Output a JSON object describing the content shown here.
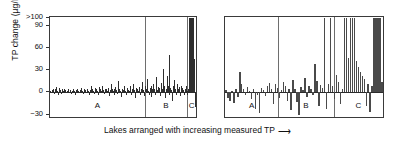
{
  "axes": {
    "ylabel": "TP change (µg/L)",
    "xlabel": "Lakes arranged with increasing measured TP",
    "xlabel_arrow": "⟶",
    "yticks": [
      {
        "label": ">100",
        "value": 100
      },
      {
        "label": "90",
        "value": 90
      },
      {
        "label": "60",
        "value": 60
      },
      {
        "label": "30",
        "value": 30
      },
      {
        "label": "0",
        "value": 0
      },
      {
        "label": "−30",
        "value": -30
      }
    ],
    "ylim": [
      -36,
      102
    ],
    "grid": false
  },
  "colors": {
    "bar": "#2e2e2e",
    "bar_wide": "#4a4a4a",
    "axis": "#3a3a3a",
    "divider": "#6e6e6e",
    "background": "#ffffff"
  },
  "panels": [
    {
      "name": "left-panel",
      "section_labels": [
        "A",
        "B",
        "C"
      ],
      "section_bounds": [
        [
          0,
          96
        ],
        [
          96,
          139
        ],
        [
          139,
          148
        ]
      ],
      "bar_width": 1.4
    },
    {
      "name": "right-panel",
      "section_labels": [
        "A",
        "B",
        "C"
      ],
      "section_bounds": [
        [
          0,
          54
        ],
        [
          54,
          110
        ],
        [
          110,
          160
        ]
      ],
      "bar_width": 3.2
    }
  ],
  "chart_data": {
    "type": "bar",
    "title": "",
    "xlabel": "Lakes arranged with increasing measured TP",
    "ylabel": "TP change (µg/L)",
    "ylim": [
      -36,
      102
    ],
    "ytick_values": [
      100,
      90,
      60,
      30,
      0,
      -30
    ],
    "ytick_labels": [
      ">100",
      "90",
      "60",
      "30",
      "0",
      "-30"
    ],
    "grid": false,
    "legend": "none",
    "note": "Two panels, each split into sections A, B, C by vertical dividers. Bars show TP change per lake; lakes sorted by increasing measured TP. Bars exceeding 100 are clipped at the top axis.",
    "panels": [
      {
        "name": "left-panel",
        "sections": [
          "A",
          "B",
          "C"
        ],
        "series": [
          {
            "name": "TP change",
            "values": [
              2,
              -1,
              3,
              5,
              -2,
              4,
              7,
              2,
              -3,
              6,
              3,
              1,
              -2,
              4,
              2,
              5,
              3,
              -1,
              2,
              4,
              1,
              3,
              -2,
              2,
              5,
              2,
              -3,
              3,
              4,
              1,
              2,
              -1,
              3,
              6,
              2,
              -2,
              4,
              3,
              1,
              5,
              2,
              -4,
              3,
              8,
              4,
              2,
              -2,
              6,
              3,
              5,
              2,
              -3,
              7,
              4,
              2,
              9,
              3,
              -2,
              5,
              4,
              2,
              6,
              -5,
              3,
              11,
              4,
              2,
              -3,
              5,
              7,
              3,
              -2,
              16,
              4,
              2,
              -6,
              5,
              3,
              8,
              2,
              -4,
              6,
              3,
              2,
              9,
              -3,
              5,
              4,
              12,
              3,
              -8,
              6,
              4,
              2,
              7,
              -4,
              5,
              14,
              3,
              -5,
              8,
              4,
              18,
              2,
              -3,
              6,
              9,
              -6,
              4,
              11,
              5,
              -4,
              21,
              3,
              7,
              6,
              -5,
              13,
              4,
              31,
              8,
              -7,
              5,
              22,
              9,
              -4,
              51,
              6,
              3,
              -12,
              8,
              17,
              5,
              -3,
              12,
              4,
              7,
              -5,
              9,
              6,
              3,
              -4,
              5,
              8,
              2,
              -3,
              4,
              100,
              100,
              100,
              100,
              100,
              45,
              -20
            ]
          }
        ]
      },
      {
        "name": "right-panel",
        "sections": [
          "A",
          "B",
          "C"
        ],
        "series": [
          {
            "name": "TP change",
            "values": [
              3,
              -8,
              -12,
              2,
              -14,
              4,
              -6,
              28,
              12,
              5,
              -3,
              7,
              2,
              -9,
              4,
              -22,
              -4,
              -28,
              6,
              3,
              -5,
              9,
              13,
              4,
              -16,
              11,
              6,
              -7,
              3,
              14,
              8,
              -11,
              5,
              -24,
              17,
              4,
              -13,
              -30,
              7,
              3,
              20,
              -6,
              9,
              5,
              -4,
              39,
              15,
              -18,
              10,
              6,
              100,
              -22,
              12,
              100,
              8,
              -9,
              24,
              14,
              -16,
              5,
              100,
              100,
              46,
              100,
              100,
              100,
              43,
              34,
              27,
              22,
              18,
              -19,
              12,
              -26,
              9,
              100,
              100,
              100,
              100,
              14
            ]
          }
        ]
      }
    ]
  }
}
